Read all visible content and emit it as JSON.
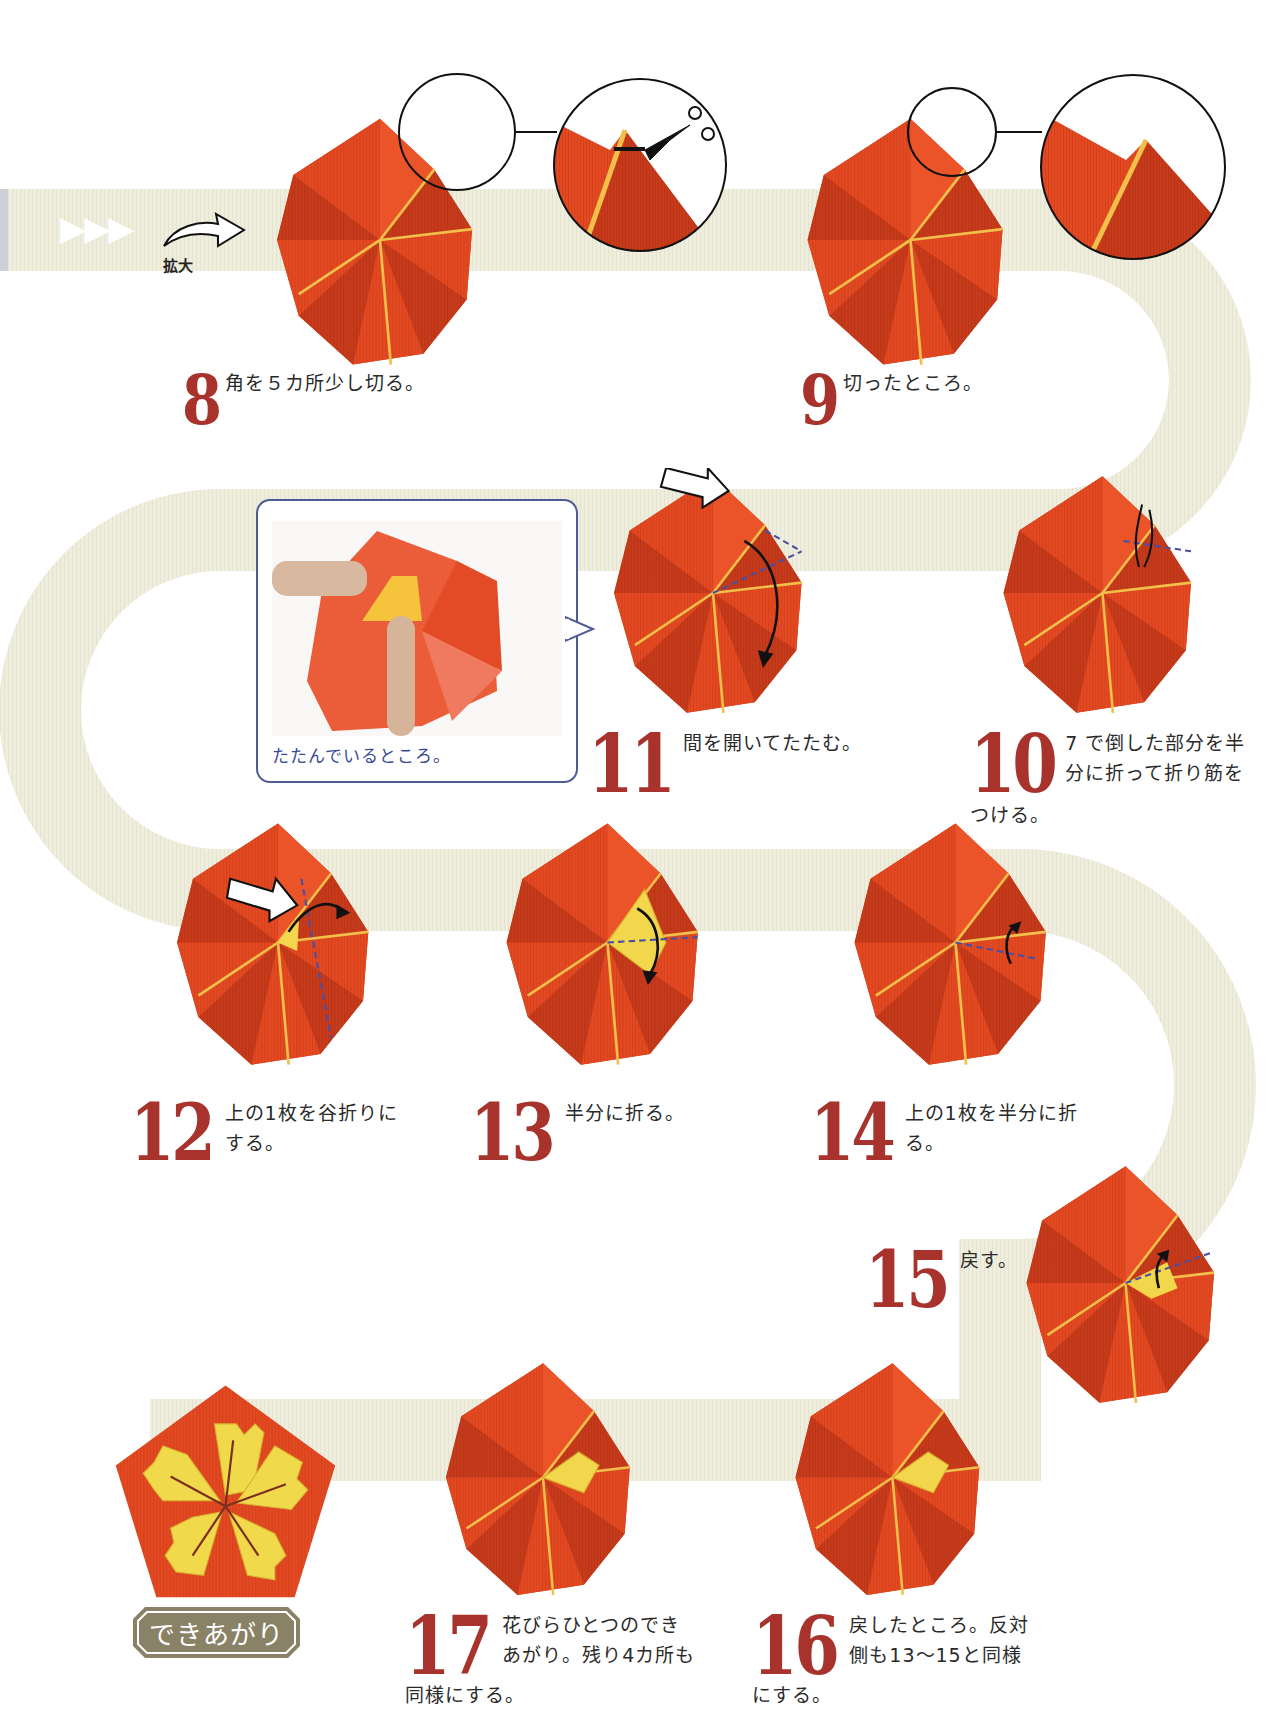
{
  "page": {
    "type": "origami-instruction-page",
    "path_color": "#eeecdb",
    "accent_red": "#a8322c",
    "paper_red": "#e0441e",
    "paper_dark_red": "#c23a1a",
    "paper_yellow": "#f2d64b",
    "bubble_border": "#4f5b96"
  },
  "intro": {
    "arrows": "▶▶▶",
    "zoom_label": "拡大"
  },
  "steps": [
    {
      "number": "8",
      "text_lines": [
        "角を５カ所少し切る。"
      ],
      "continuation": ""
    },
    {
      "number": "9",
      "text_lines": [
        "切ったところ。"
      ],
      "continuation": ""
    },
    {
      "number": "10",
      "text_lines": [
        "7 で倒した部分を半",
        "分に折って折り筋を"
      ],
      "continuation": "つける。"
    },
    {
      "number": "11",
      "text_lines": [
        "間を開いてたたむ。"
      ],
      "continuation": ""
    },
    {
      "number": "12",
      "text_lines": [
        "上の1枚を谷折りに",
        "する。"
      ],
      "continuation": ""
    },
    {
      "number": "13",
      "text_lines": [
        "半分に折る。"
      ],
      "continuation": ""
    },
    {
      "number": "14",
      "text_lines": [
        "上の1枚を半分に折",
        "る。"
      ],
      "continuation": ""
    },
    {
      "number": "15",
      "text_lines": [
        "戻す。"
      ],
      "continuation": ""
    },
    {
      "number": "16",
      "text_lines": [
        "戻したところ。反対",
        "側も13～15と同様"
      ],
      "continuation": "にする。"
    },
    {
      "number": "17",
      "text_lines": [
        "花びらひとつのでき",
        "あがり。残り4カ所も"
      ],
      "continuation": "同様にする。"
    }
  ],
  "photo_bubble": {
    "caption": "たたんでいるところ。"
  },
  "finished": {
    "label": "できあがり"
  }
}
